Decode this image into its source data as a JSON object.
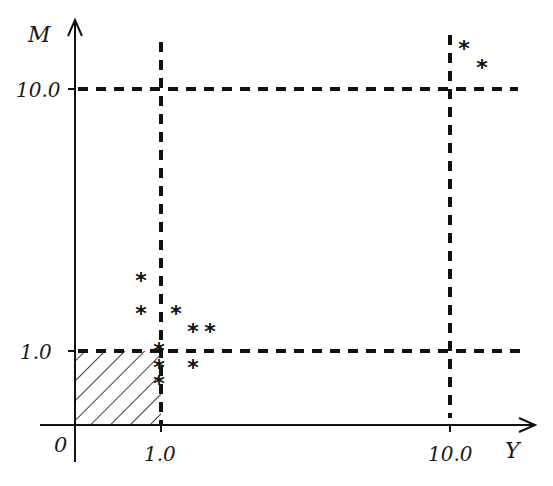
{
  "diagram": {
    "axes": {
      "x_label": "Y",
      "y_label": "M",
      "origin_label": "0",
      "x_ticks": [
        {
          "label": "1.0",
          "value": 1.0
        },
        {
          "label": "10.0",
          "value": 10.0
        }
      ],
      "y_ticks": [
        {
          "label": "1.0",
          "value": 1.0
        },
        {
          "label": "10.0",
          "value": 10.0
        }
      ]
    },
    "threshold_lines": [
      {
        "orientation": "vertical",
        "at": "Y=1.0",
        "style": "dashed"
      },
      {
        "orientation": "vertical",
        "at": "Y=10.0",
        "style": "dashed"
      },
      {
        "orientation": "horizontal",
        "at": "M=1.0",
        "style": "dashed"
      },
      {
        "orientation": "horizontal",
        "at": "M=10.0",
        "style": "dashed"
      }
    ],
    "hatched_region": {
      "x_range": [
        0,
        1.0
      ],
      "y_range": [
        0,
        1.0
      ]
    },
    "point_marker": "*",
    "points_px": [
      [
        141,
        279
      ],
      [
        141,
        312
      ],
      [
        176,
        312
      ],
      [
        193,
        330
      ],
      [
        210,
        330
      ],
      [
        159,
        349
      ],
      [
        159,
        366
      ],
      [
        193,
        366
      ],
      [
        159,
        382
      ],
      [
        464,
        47
      ],
      [
        482,
        66
      ]
    ]
  }
}
